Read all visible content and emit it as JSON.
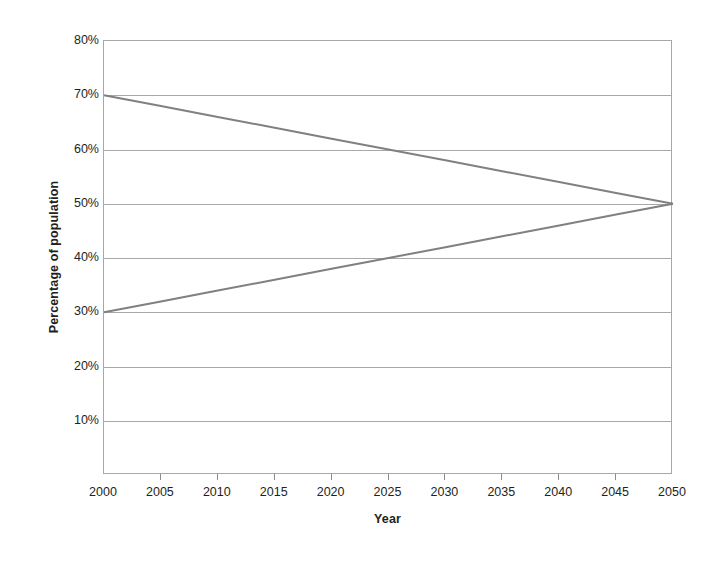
{
  "chart_data": {
    "type": "line",
    "title": "",
    "subtitle": "",
    "xlabel": "Year",
    "ylabel": "Percentage of population",
    "x": [
      2000,
      2005,
      2010,
      2015,
      2020,
      2025,
      2030,
      2035,
      2040,
      2045,
      2050
    ],
    "xlim": [
      2000,
      2050
    ],
    "ylim": [
      0,
      80
    ],
    "grid": true,
    "legend": "none",
    "x_tick_labels": [
      "2000",
      "2005",
      "2010",
      "2015",
      "2020",
      "2025",
      "2030",
      "2035",
      "2040",
      "2045",
      "2050"
    ],
    "y_tick_values": [
      10,
      20,
      30,
      40,
      50,
      60,
      70,
      80
    ],
    "y_tick_labels": [
      "10%",
      "20%",
      "30%",
      "40%",
      "50%",
      "60%",
      "70%",
      "80%"
    ],
    "series": [
      {
        "name": "declining-share",
        "color": "#808080",
        "values": [
          70,
          68,
          66,
          64,
          62,
          60,
          58,
          56,
          54,
          52,
          50
        ]
      },
      {
        "name": "rising-share",
        "color": "#808080",
        "values": [
          30,
          32,
          34,
          36,
          38,
          40,
          42,
          44,
          46,
          48,
          50
        ]
      }
    ],
    "annotations": []
  },
  "colors": {
    "background": "#ffffff",
    "axis": "#a8a8a8",
    "gridline": "#a8a8a8",
    "tick_mark": "#8c8c8c",
    "text": "#231f20",
    "series_line": "#808080"
  }
}
